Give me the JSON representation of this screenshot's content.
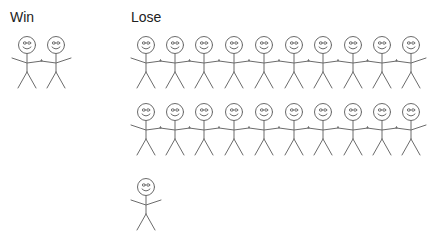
{
  "groups": {
    "win": {
      "label": "Win",
      "count": 2
    },
    "lose": {
      "label": "Lose",
      "count": 21,
      "rows": [
        10,
        10,
        1
      ]
    }
  },
  "figures": {
    "win": [
      {
        "x": 27,
        "y": 45,
        "linked": true
      },
      {
        "x": 56,
        "y": 45,
        "linked": true
      }
    ],
    "lose_row1": [
      146,
      175,
      204,
      234,
      264,
      294,
      323,
      353,
      382,
      411
    ],
    "lose_row1_y": 45,
    "lose_row2": [
      146,
      175,
      204,
      234,
      264,
      294,
      323,
      353,
      382,
      411
    ],
    "lose_row2_y": 112,
    "lose_single": {
      "x": 146,
      "y": 187
    }
  },
  "colors": {
    "stroke": "#6b6b6b",
    "text": "#222222",
    "background": "#ffffff"
  }
}
